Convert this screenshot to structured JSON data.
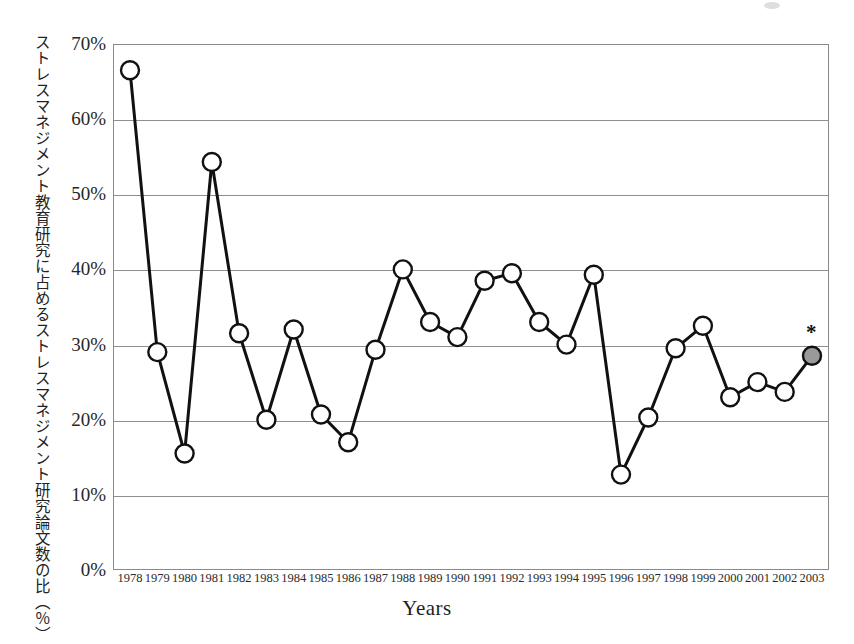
{
  "figure": {
    "y_axis_title": "ストレスマネジメント教育研究に占めるストレスマネジメント研究論文数の比（％）",
    "x_axis_title": "Years",
    "annotation": "*"
  },
  "chart_data": {
    "type": "line",
    "title": "",
    "xlabel": "Years",
    "ylabel": "ストレスマネジメント教育研究に占めるストレスマネジメント研究論文数の比（％）",
    "ylim": [
      0,
      70
    ],
    "ytick_labels": [
      "70%",
      "60%",
      "50%",
      "40%",
      "30%",
      "20%",
      "10%",
      "0%"
    ],
    "ytick_values": [
      70,
      60,
      50,
      40,
      30,
      20,
      10,
      0
    ],
    "grid": true,
    "legend": "none",
    "categories": [
      "1978",
      "1979",
      "1980",
      "1981",
      "1982",
      "1983",
      "1984",
      "1985",
      "1986",
      "1987",
      "1988",
      "1989",
      "1990",
      "1991",
      "1992",
      "1993",
      "1994",
      "1995",
      "1996",
      "1997",
      "1998",
      "1999",
      "2000",
      "2001",
      "2002",
      "2003"
    ],
    "values": [
      66.5,
      29.0,
      15.5,
      54.3,
      31.5,
      20.0,
      32.0,
      20.7,
      17.0,
      29.3,
      40.0,
      33.0,
      31.0,
      38.5,
      39.5,
      33.0,
      30.0,
      39.3,
      12.7,
      20.3,
      29.5,
      32.5,
      23.0,
      25.0,
      23.7,
      28.5
    ],
    "marker": {
      "shape": "circle",
      "fill": "#ffffff",
      "edge": "#111111",
      "radius": 9
    },
    "highlight_point": {
      "category": "2003",
      "value": 28.5,
      "fill": "#9a9a9a",
      "note": "*"
    },
    "line_color": "#111111",
    "line_width": 3
  },
  "colors": {
    "line": "#111111",
    "marker_fill": "#ffffff",
    "marker_edge": "#111111",
    "highlight_fill": "#9a9a9a",
    "grid": "#8f8f8f",
    "frame": "#8a8a8a"
  }
}
